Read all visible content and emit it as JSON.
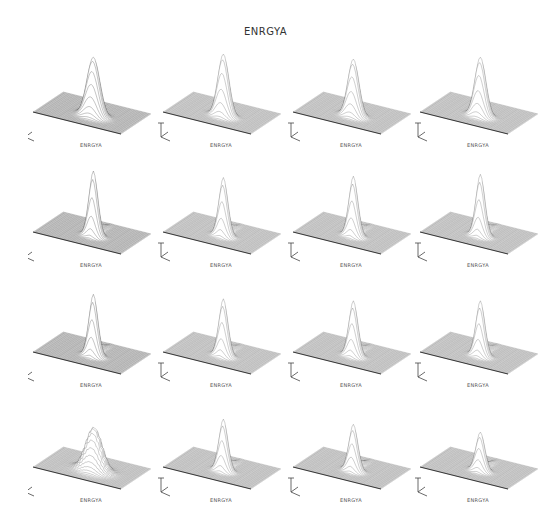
{
  "chart_data": {
    "type": "surface_3d_grid",
    "title": "ENRGYA",
    "layout": {
      "rows": 4,
      "cols": 4
    },
    "panels": [
      {
        "row": 0,
        "col": 0,
        "label": "ENRGYA",
        "peak_height": 0.95,
        "peak_x": 0.55,
        "peak_y": 0.4,
        "width": 0.07,
        "ridge": 0.0,
        "noisy": false
      },
      {
        "row": 0,
        "col": 1,
        "label": "ENRGYA",
        "peak_height": 1.0,
        "peak_x": 0.55,
        "peak_y": 0.4,
        "width": 0.06,
        "ridge": 0.0,
        "noisy": false
      },
      {
        "row": 0,
        "col": 2,
        "label": "ENRGYA",
        "peak_height": 0.92,
        "peak_x": 0.55,
        "peak_y": 0.4,
        "width": 0.06,
        "ridge": 0.0,
        "noisy": false
      },
      {
        "row": 0,
        "col": 3,
        "label": "ENRGYA",
        "peak_height": 0.95,
        "peak_x": 0.55,
        "peak_y": 0.4,
        "width": 0.06,
        "ridge": 0.0,
        "noisy": false
      },
      {
        "row": 1,
        "col": 0,
        "label": "ENRGYA",
        "peak_height": 1.0,
        "peak_x": 0.55,
        "peak_y": 0.4,
        "width": 0.05,
        "ridge": 0.4,
        "noisy": false
      },
      {
        "row": 1,
        "col": 1,
        "label": "ENRGYA",
        "peak_height": 0.9,
        "peak_x": 0.55,
        "peak_y": 0.4,
        "width": 0.05,
        "ridge": 0.4,
        "noisy": false
      },
      {
        "row": 1,
        "col": 2,
        "label": "ENRGYA",
        "peak_height": 0.92,
        "peak_x": 0.55,
        "peak_y": 0.4,
        "width": 0.05,
        "ridge": 0.4,
        "noisy": false
      },
      {
        "row": 1,
        "col": 3,
        "label": "ENRGYA",
        "peak_height": 0.95,
        "peak_x": 0.55,
        "peak_y": 0.4,
        "width": 0.05,
        "ridge": 0.4,
        "noisy": false
      },
      {
        "row": 2,
        "col": 0,
        "label": "ENRGYA",
        "peak_height": 0.95,
        "peak_x": 0.55,
        "peak_y": 0.4,
        "width": 0.05,
        "ridge": 0.4,
        "noisy": false
      },
      {
        "row": 2,
        "col": 1,
        "label": "ENRGYA",
        "peak_height": 0.88,
        "peak_x": 0.55,
        "peak_y": 0.4,
        "width": 0.05,
        "ridge": 0.4,
        "noisy": false
      },
      {
        "row": 2,
        "col": 2,
        "label": "ENRGYA",
        "peak_height": 0.85,
        "peak_x": 0.55,
        "peak_y": 0.4,
        "width": 0.05,
        "ridge": 0.4,
        "noisy": false
      },
      {
        "row": 2,
        "col": 3,
        "label": "ENRGYA",
        "peak_height": 0.85,
        "peak_x": 0.55,
        "peak_y": 0.4,
        "width": 0.05,
        "ridge": 0.4,
        "noisy": false
      },
      {
        "row": 3,
        "col": 0,
        "label": "ENRGYA",
        "peak_height": 0.75,
        "peak_x": 0.55,
        "peak_y": 0.42,
        "width": 0.09,
        "ridge": 0.0,
        "noisy": true
      },
      {
        "row": 3,
        "col": 1,
        "label": "ENRGYA",
        "peak_height": 0.8,
        "peak_x": 0.55,
        "peak_y": 0.4,
        "width": 0.05,
        "ridge": 0.4,
        "noisy": false
      },
      {
        "row": 3,
        "col": 2,
        "label": "ENRGYA",
        "peak_height": 0.72,
        "peak_x": 0.55,
        "peak_y": 0.4,
        "width": 0.05,
        "ridge": 0.4,
        "noisy": false
      },
      {
        "row": 3,
        "col": 3,
        "label": "ENRGYA",
        "peak_height": 0.6,
        "peak_x": 0.55,
        "peak_y": 0.4,
        "width": 0.05,
        "ridge": 0.4,
        "noisy": false
      }
    ],
    "xlabel": "ENRGYA",
    "grid": false,
    "legend": null
  }
}
